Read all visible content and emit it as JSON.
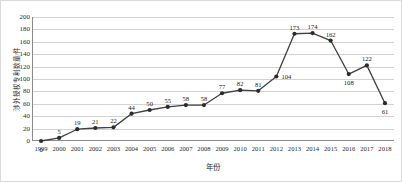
{
  "chart_data": {
    "type": "line",
    "title": "",
    "xlabel": "年份",
    "ylabel": "涉外授权专利数量/件",
    "categories": [
      "1999",
      "2000",
      "2001",
      "2002",
      "2003",
      "2004",
      "2005",
      "2006",
      "2007",
      "2008",
      "2009",
      "2010",
      "2011",
      "2012",
      "2013",
      "2014",
      "2015",
      "2016",
      "2017",
      "2018"
    ],
    "values": [
      0,
      5,
      19,
      21,
      22,
      44,
      50,
      55,
      58,
      58,
      77,
      82,
      81,
      104,
      173,
      174,
      162,
      108,
      122,
      61
    ],
    "series": [
      {
        "name": "涉外授权专利数量",
        "values": [
          0,
          5,
          19,
          21,
          22,
          44,
          50,
          55,
          58,
          58,
          77,
          82,
          81,
          104,
          173,
          174,
          162,
          108,
          122,
          61
        ]
      }
    ],
    "data_labels": [
      "0",
      "5",
      "19",
      "21",
      "22",
      "44",
      "50",
      "55",
      "58",
      "58",
      "77",
      "82",
      "81",
      "104",
      "173",
      "174",
      "162",
      "108",
      "122",
      "61"
    ],
    "ylim": [
      0,
      200
    ],
    "ytick_values": [
      0,
      20,
      40,
      60,
      80,
      100,
      120,
      140,
      160,
      180,
      200
    ],
    "ytick_labels": [
      "0",
      "20",
      "40",
      "60",
      "80",
      "100",
      "120",
      "140",
      "160",
      "180",
      "200"
    ],
    "grid": true,
    "legend": "none",
    "line_color": "#3f3f3f",
    "marker_color": "#2b2b2b",
    "marker_shape": "circle",
    "grid_color": "#d2d2d2",
    "axis_color": "#8a8a8a",
    "background_color": "#ffffff",
    "label_positions": [
      "below",
      "above",
      "above",
      "above",
      "above",
      "above",
      "above",
      "above",
      "above",
      "above",
      "above",
      "above",
      "above",
      "right",
      "above",
      "above",
      "above",
      "below",
      "above",
      "below"
    ]
  }
}
